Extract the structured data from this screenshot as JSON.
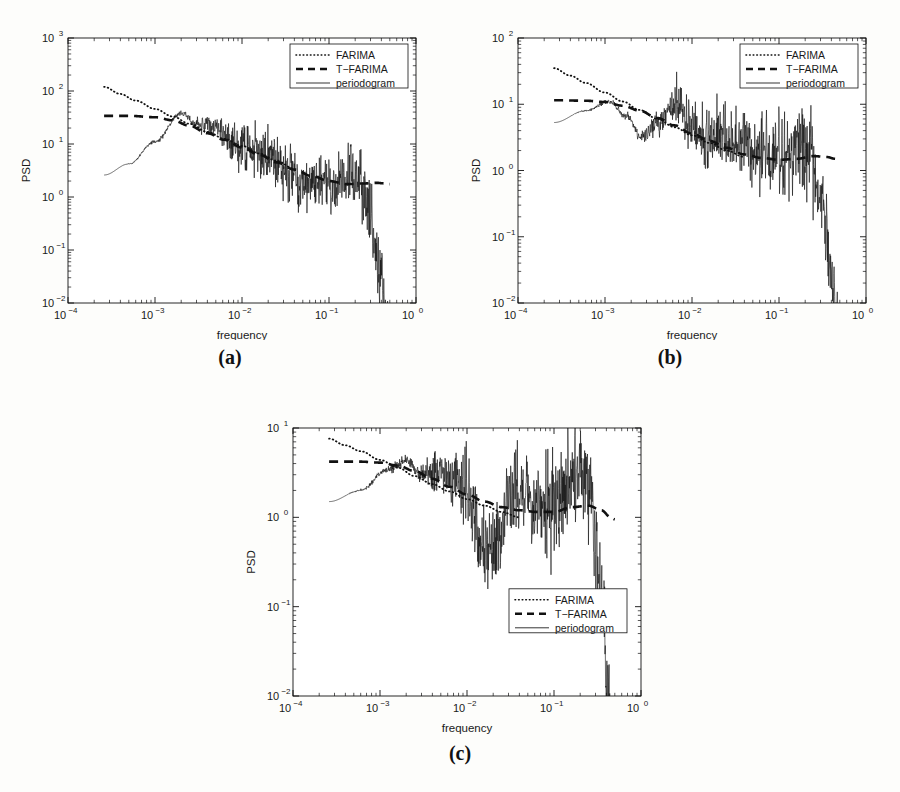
{
  "figure": {
    "background": "#fdfdfb",
    "ink": "#111111"
  },
  "panels": [
    {
      "id": "a",
      "caption": "(a)",
      "axes": {
        "xlabel": "frequency",
        "ylabel": "PSD",
        "xscale": "log",
        "yscale": "log",
        "xlim": [
          0.0001,
          1
        ],
        "ylim": [
          0.01,
          1000
        ],
        "xticks": [
          "10^-4",
          "10^-3",
          "10^-2",
          "10^-1",
          "10^0"
        ],
        "xtick_exponents": [
          "-4",
          "-3",
          "-2",
          "-1",
          "0"
        ],
        "yticks": [
          "10^-2",
          "10^-1",
          "10^0",
          "10^1",
          "10^2",
          "10^3"
        ],
        "ytick_exponents": [
          "-2",
          "-1",
          "0",
          "1",
          "2",
          "3"
        ],
        "grid": false,
        "box": true,
        "minor_ticks": true
      },
      "legend": {
        "position": "top-right",
        "entries": [
          {
            "label": "FARIMA",
            "style": "dotted"
          },
          {
            "label": "T−FARIMA",
            "style": "dashed"
          },
          {
            "label": "periodogram",
            "style": "solid"
          }
        ]
      },
      "chart_data": {
        "type": "line",
        "title": "",
        "xlabel": "frequency",
        "ylabel": "PSD",
        "xscale": "log",
        "yscale": "log",
        "xlim": [
          0.0001,
          1
        ],
        "ylim": [
          0.01,
          1000
        ],
        "series": [
          {
            "name": "FARIMA",
            "style": "dotted",
            "x": [
              0.00026,
              0.0004,
              0.0006,
              0.001,
              0.0016,
              0.0025,
              0.004,
              0.0063,
              0.01,
              0.016,
              0.025,
              0.04
            ],
            "y": [
              120,
              88,
              66,
              46,
              33,
              24,
              17,
              12.5,
              9.2,
              6.6,
              4.8,
              3.4
            ]
          },
          {
            "name": "T−FARIMA",
            "style": "dashed",
            "x": [
              0.00026,
              0.0005,
              0.001,
              0.0016,
              0.0025,
              0.004,
              0.0063,
              0.01,
              0.016,
              0.025,
              0.04,
              0.063,
              0.1,
              0.16,
              0.25,
              0.35,
              0.45,
              0.5
            ],
            "y": [
              34,
              34,
              32,
              28,
              22,
              16,
              12,
              8.6,
              6.2,
              4.5,
              3.3,
              2.5,
              2.0,
              1.75,
              1.8,
              1.85,
              1.8,
              1.75
            ]
          },
          {
            "name": "periodogram",
            "style": "solid",
            "note": "noisy spectral estimate rising from 2.6 at 2.6e-4 to peak ~38 near 2e-3, then decaying with oscillations, heavy scatter above 3e-2, sharp roll-off past 2.5e-1 down to ~0.06 at 0.5",
            "x": [
              0.00026,
              0.0005,
              0.001,
              0.002,
              0.003,
              0.005,
              0.008,
              0.012,
              0.02,
              0.035,
              0.06,
              0.1,
              0.2,
              0.3,
              0.45,
              0.5
            ],
            "y": [
              2.6,
              4.2,
              11,
              38,
              24,
              21,
              11,
              7.5,
              6.0,
              3.2,
              1.6,
              1.7,
              2.2,
              1.0,
              0.2,
              0.12
            ]
          }
        ]
      }
    },
    {
      "id": "b",
      "caption": "(b)",
      "axes": {
        "xlabel": "frequency",
        "ylabel": "PSD",
        "xscale": "log",
        "yscale": "log",
        "xlim": [
          0.0001,
          1
        ],
        "ylim": [
          0.01,
          100
        ],
        "xticks": [
          "10^-4",
          "10^-3",
          "10^-2",
          "10^-1",
          "10^0"
        ],
        "xtick_exponents": [
          "-4",
          "-3",
          "-2",
          "-1",
          "0"
        ],
        "yticks": [
          "10^-2",
          "10^-1",
          "10^0",
          "10^1",
          "10^2"
        ],
        "ytick_exponents": [
          "-2",
          "-1",
          "0",
          "1",
          "2"
        ],
        "grid": false,
        "box": true,
        "minor_ticks": true
      },
      "legend": {
        "position": "top-right",
        "entries": [
          {
            "label": "FARIMA",
            "style": "dotted"
          },
          {
            "label": "T−FARIMA",
            "style": "dashed"
          },
          {
            "label": "periodogram",
            "style": "solid"
          }
        ]
      },
      "chart_data": {
        "type": "line",
        "title": "",
        "xlabel": "frequency",
        "ylabel": "PSD",
        "xscale": "log",
        "yscale": "log",
        "xlim": [
          0.0001,
          1
        ],
        "ylim": [
          0.01,
          100
        ],
        "series": [
          {
            "name": "FARIMA",
            "style": "dotted",
            "x": [
              0.00026,
              0.0004,
              0.0006,
              0.001,
              0.0016,
              0.0025,
              0.004,
              0.0063,
              0.01,
              0.016,
              0.025,
              0.04
            ],
            "y": [
              35,
              27,
              21,
              15,
              11,
              8.2,
              6.0,
              4.5,
              3.4,
              2.6,
              2.0,
              1.6
            ]
          },
          {
            "name": "T−FARIMA",
            "style": "dashed",
            "x": [
              0.00026,
              0.0006,
              0.001,
              0.0016,
              0.0025,
              0.004,
              0.0063,
              0.01,
              0.016,
              0.025,
              0.04,
              0.063,
              0.1,
              0.16,
              0.25,
              0.35,
              0.45,
              0.5
            ],
            "y": [
              11.5,
              11.3,
              10.8,
              9.5,
              8.0,
              6.2,
              4.8,
              3.6,
              2.8,
              2.2,
              1.75,
              1.55,
              1.45,
              1.5,
              1.65,
              1.6,
              1.5,
              1.45
            ]
          },
          {
            "name": "periodogram",
            "style": "solid",
            "note": "starts ~5.3 at 2.6e-4, rises to ~11 at 1.1e-3, deep notch to ~3.2 at 2.6e-3, recovers to ~9.5 at 6.5e-3, then noisy decay with large scatter, sharp roll-off past 2.5e-1 to ~0.03 at 0.5",
            "x": [
              0.00026,
              0.0006,
              0.0011,
              0.0018,
              0.0026,
              0.004,
              0.0065,
              0.009,
              0.013,
              0.02,
              0.035,
              0.06,
              0.1,
              0.2,
              0.3,
              0.45,
              0.5
            ],
            "y": [
              5.3,
              8.0,
              11.0,
              6.5,
              3.2,
              5.2,
              9.5,
              4.6,
              3.0,
              3.6,
              2.4,
              1.9,
              1.6,
              2.3,
              0.9,
              0.18,
              0.09
            ]
          }
        ]
      }
    },
    {
      "id": "c",
      "caption": "(c)",
      "axes": {
        "xlabel": "frequency",
        "ylabel": "PSD",
        "xscale": "log",
        "yscale": "log",
        "xlim": [
          0.0001,
          1
        ],
        "ylim": [
          0.01,
          10
        ],
        "xticks": [
          "10^-4",
          "10^-3",
          "10^-2",
          "10^-1",
          "10^0"
        ],
        "xtick_exponents": [
          "-4",
          "-3",
          "-2",
          "-1",
          "0"
        ],
        "yticks": [
          "10^-2",
          "10^-1",
          "10^0",
          "10^1"
        ],
        "ytick_exponents": [
          "-2",
          "-1",
          "0",
          "1"
        ],
        "grid": false,
        "box": true,
        "minor_ticks": true
      },
      "legend": {
        "position": "bottom-right",
        "entries": [
          {
            "label": "FARIMA",
            "style": "dotted"
          },
          {
            "label": "T−FARIMA",
            "style": "dashed"
          },
          {
            "label": "periodogram",
            "style": "solid"
          }
        ]
      },
      "chart_data": {
        "type": "line",
        "title": "",
        "xlabel": "frequency",
        "ylabel": "PSD",
        "xscale": "log",
        "yscale": "log",
        "xlim": [
          0.0001,
          1
        ],
        "ylim": [
          0.01,
          10
        ],
        "series": [
          {
            "name": "FARIMA",
            "style": "dotted",
            "x": [
              0.00026,
              0.0004,
              0.0006,
              0.001,
              0.0016,
              0.0025,
              0.004,
              0.0063,
              0.01,
              0.016,
              0.025,
              0.04
            ],
            "y": [
              7.6,
              6.4,
              5.5,
              4.4,
              3.6,
              2.9,
              2.35,
              1.95,
              1.6,
              1.35,
              1.15,
              1.0
            ]
          },
          {
            "name": "T−FARIMA",
            "style": "dashed",
            "x": [
              0.00026,
              0.0006,
              0.001,
              0.0016,
              0.0025,
              0.004,
              0.0063,
              0.01,
              0.016,
              0.025,
              0.04,
              0.063,
              0.1,
              0.16,
              0.25,
              0.35,
              0.45,
              0.5
            ],
            "y": [
              4.2,
              4.2,
              4.1,
              3.8,
              3.3,
              2.7,
              2.2,
              1.8,
              1.5,
              1.3,
              1.2,
              1.15,
              1.15,
              1.3,
              1.35,
              1.2,
              1.0,
              0.95
            ]
          },
          {
            "name": "periodogram",
            "style": "solid",
            "note": "starts ~1.5 at 2.6e-4, climbs to peak ~4.3 near 2e-3, oscillates through 5e-3 to 1e-2, deep dips to ~0.35 around 1.5e-2, broad noisy plateau near 1–3 between 3e-2 and 2.5e-1, then steep decay to ~0.06 at 0.5",
            "x": [
              0.00026,
              0.0006,
              0.0012,
              0.002,
              0.003,
              0.005,
              0.007,
              0.01,
              0.015,
              0.02,
              0.035,
              0.06,
              0.1,
              0.18,
              0.25,
              0.35,
              0.45,
              0.5
            ],
            "y": [
              1.5,
              2.0,
              3.4,
              4.3,
              3.0,
              3.3,
              2.6,
              2.1,
              0.45,
              0.38,
              2.2,
              1.4,
              1.3,
              3.6,
              2.2,
              0.6,
              0.12,
              0.09
            ]
          }
        ]
      }
    }
  ]
}
